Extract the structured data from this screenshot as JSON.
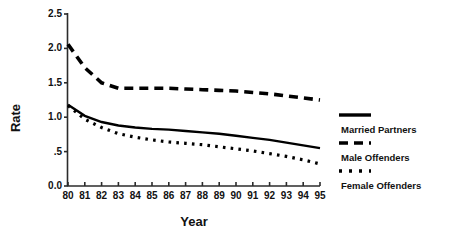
{
  "chart_data": {
    "type": "line",
    "title": "",
    "xlabel": "Year",
    "ylabel": "Rate",
    "x": [
      80,
      81,
      82,
      83,
      84,
      85,
      86,
      87,
      88,
      89,
      90,
      91,
      92,
      93,
      94,
      95
    ],
    "xtick_labels": [
      "80",
      "81",
      "82",
      "83",
      "84",
      "85",
      "86",
      "87",
      "88",
      "89",
      "90",
      "91",
      "92",
      "93",
      "94",
      "95"
    ],
    "ytick_labels": [
      "0.0",
      ".5",
      "1.0",
      "1.5",
      "2.0",
      "2.5"
    ],
    "ytick_values": [
      0.0,
      0.5,
      1.0,
      1.5,
      2.0,
      2.5
    ],
    "xlim": [
      80,
      95
    ],
    "ylim": [
      0.0,
      2.5
    ],
    "grid": false,
    "legend_position": "right",
    "series": [
      {
        "name": "Married Partners",
        "style": "dashed",
        "values": [
          2.06,
          1.72,
          1.5,
          1.42,
          1.42,
          1.42,
          1.42,
          1.41,
          1.4,
          1.39,
          1.38,
          1.36,
          1.34,
          1.31,
          1.28,
          1.25
        ]
      },
      {
        "name": "Male Offenders",
        "style": "solid",
        "values": [
          1.18,
          1.02,
          0.93,
          0.88,
          0.85,
          0.83,
          0.82,
          0.8,
          0.78,
          0.76,
          0.73,
          0.7,
          0.67,
          0.63,
          0.59,
          0.55
        ]
      },
      {
        "name": "Female Offenders",
        "style": "dotted",
        "values": [
          1.17,
          0.97,
          0.85,
          0.76,
          0.71,
          0.67,
          0.64,
          0.62,
          0.6,
          0.57,
          0.54,
          0.51,
          0.47,
          0.43,
          0.38,
          0.32
        ]
      }
    ]
  },
  "axes": {
    "y_title": "Rate",
    "x_title": "Year"
  },
  "legend": {
    "items": [
      {
        "label": "Married Partners",
        "swatch": "solid-swatch"
      },
      {
        "label": "Male Offenders",
        "swatch": "dashed-swatch"
      },
      {
        "label": "Female Offenders",
        "swatch": "dotted-swatch"
      }
    ]
  },
  "colors": {
    "ink": "#000000",
    "axis": "#2b2b2b",
    "background": "#ffffff"
  }
}
